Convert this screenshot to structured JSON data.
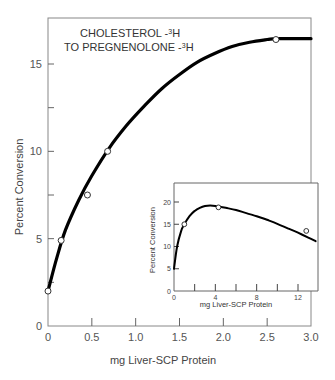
{
  "chart_data": [
    {
      "type": "scatter",
      "role": "main",
      "title": "",
      "annotation_line1": "CHOLESTEROL -",
      "annotation_line1_sup": "3",
      "annotation_line1_end": "H",
      "annotation_line2": "TO PREGNENOLONE  -",
      "annotation_line2_sup": "3",
      "annotation_line2_end": "H",
      "xlabel": "mg Liver-SCP Protein",
      "ylabel": "Percent Conversion",
      "xlim": [
        0,
        3.0
      ],
      "ylim": [
        0,
        17.6
      ],
      "xticks": [
        0,
        0.5,
        1.0,
        1.5,
        2.0,
        2.5,
        3.0
      ],
      "xtick_labels": [
        "0",
        "0.5",
        "1.0",
        "1.5",
        "2.0",
        "2.5",
        "3.0"
      ],
      "yticks": [
        0,
        2.5,
        5,
        7.5,
        10,
        12.5,
        15
      ],
      "ytick_labels": [
        "0",
        "",
        "5",
        "",
        "10",
        "",
        "15"
      ],
      "points": {
        "x": [
          0,
          0.15,
          0.45,
          0.68,
          2.6
        ],
        "y": [
          2.0,
          4.9,
          7.5,
          10.0,
          16.4
        ]
      },
      "curve": {
        "x": [
          0,
          0.1,
          0.2,
          0.35,
          0.5,
          0.7,
          0.9,
          1.1,
          1.3,
          1.5,
          1.7,
          1.9,
          2.1,
          2.3,
          2.5,
          2.6,
          2.8,
          3.0
        ],
        "y": [
          2.0,
          3.9,
          5.5,
          7.2,
          8.6,
          10.2,
          11.5,
          12.6,
          13.6,
          14.4,
          15.1,
          15.6,
          16.0,
          16.25,
          16.4,
          16.45,
          16.45,
          16.45
        ]
      },
      "grid": false
    },
    {
      "type": "scatter",
      "role": "inset",
      "xlabel": "mg Liver-SCP Protein",
      "ylabel": "Percent Conversion",
      "xlim": [
        0,
        13.7
      ],
      "ylim": [
        0,
        25
      ],
      "xticks": [
        0,
        2,
        4,
        6,
        8,
        10,
        12
      ],
      "xtick_labels": [
        "0",
        "",
        "4",
        "",
        "8",
        "",
        "12"
      ],
      "yticks": [
        0,
        5,
        10,
        15,
        20
      ],
      "ytick_labels": [
        "0",
        "5",
        "10",
        "15",
        "20"
      ],
      "points": {
        "x": [
          1.0,
          4.3,
          12.8
        ],
        "y": [
          15.0,
          18.8,
          13.5
        ]
      },
      "curve": {
        "x": [
          0,
          0.3,
          0.7,
          1.0,
          1.5,
          2.0,
          2.5,
          3.0,
          3.5,
          4.0,
          5.0,
          6.0,
          7.0,
          8.0,
          9.0,
          10.0,
          11.0,
          12.0,
          13.0,
          13.7
        ],
        "y": [
          5.0,
          10.0,
          13.5,
          15.0,
          16.8,
          18.0,
          18.7,
          19.1,
          19.2,
          19.1,
          18.7,
          18.2,
          17.5,
          16.8,
          16.0,
          15.1,
          14.1,
          13.1,
          12.0,
          11.2
        ]
      },
      "grid": false
    }
  ]
}
